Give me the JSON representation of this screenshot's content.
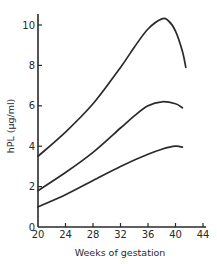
{
  "chart_data": {
    "type": "line",
    "title": "",
    "xlabel": "Weeks of gestation",
    "ylabel": "hPL (μg/ml)",
    "xlim": [
      20,
      44
    ],
    "ylim": [
      0,
      10.5
    ],
    "xticks": [
      20,
      24,
      28,
      32,
      36,
      40,
      44
    ],
    "yticks": [
      0,
      2,
      4,
      6,
      8,
      10
    ],
    "grid": false,
    "legend": null,
    "series": [
      {
        "name": "upper",
        "x": [
          20,
          24,
          28,
          32,
          34,
          36,
          38,
          39,
          40,
          41,
          41.5
        ],
        "y": [
          3.5,
          4.7,
          6.1,
          7.9,
          8.9,
          9.8,
          10.3,
          10.2,
          9.7,
          8.7,
          7.9
        ]
      },
      {
        "name": "middle",
        "x": [
          20,
          24,
          28,
          32,
          34,
          36,
          38,
          40,
          41
        ],
        "y": [
          1.8,
          2.7,
          3.7,
          4.9,
          5.5,
          6.0,
          6.2,
          6.1,
          5.9
        ]
      },
      {
        "name": "lower",
        "x": [
          20,
          24,
          28,
          32,
          36,
          38,
          40,
          41
        ],
        "y": [
          1.0,
          1.6,
          2.3,
          3.0,
          3.6,
          3.85,
          4.0,
          3.95
        ]
      }
    ]
  },
  "axes": {
    "x_tick_labels": [
      "20",
      "24",
      "28",
      "32",
      "36",
      "40",
      "44"
    ],
    "y_tick_labels": [
      "0",
      "2",
      "4",
      "6",
      "8",
      "10"
    ],
    "xlabel": "Weeks of gestation",
    "ylabel": "hPL (μg/ml)"
  },
  "style": {
    "line_color": "#2a2a2a",
    "background": "#ffffff"
  }
}
